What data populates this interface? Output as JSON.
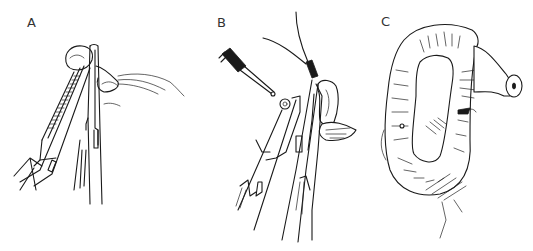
{
  "figure": {
    "panels": [
      {
        "label": "A",
        "content": "Two needle holders / clamps grasping a tissue loop"
      },
      {
        "label": "B",
        "content": "Clamps with suture and cautery/instrument tip approaching tissue"
      },
      {
        "label": "C",
        "content": "Ring-shaped bowel loop with sutured stoma opening"
      }
    ]
  }
}
